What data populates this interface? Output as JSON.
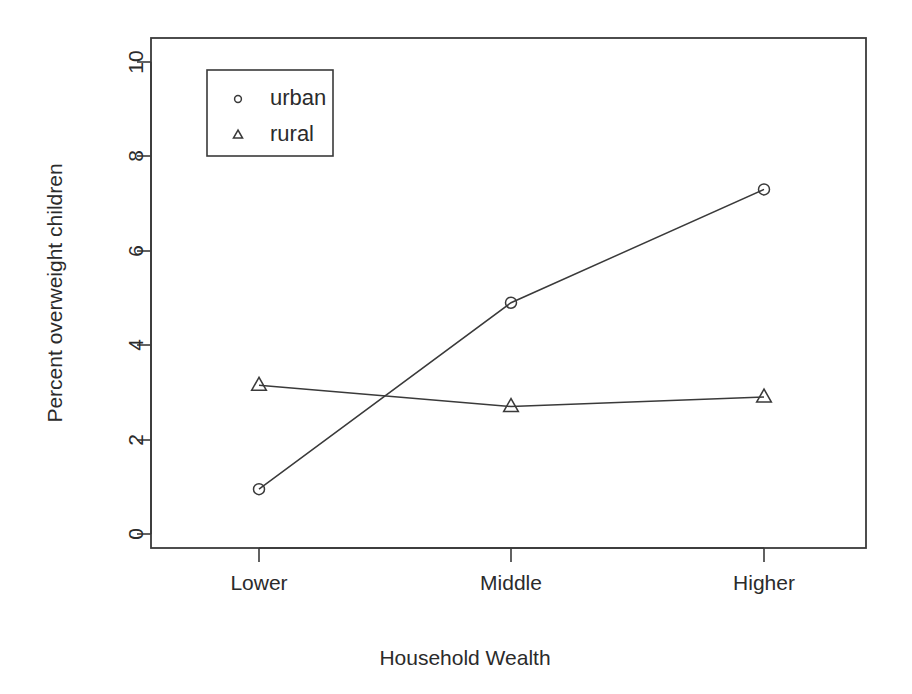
{
  "chart_data": {
    "type": "line",
    "title": "",
    "xlabel": "Household Wealth",
    "ylabel": "Percent overweight children",
    "categories": [
      "Lower",
      "Middle",
      "Higher"
    ],
    "ylim": [
      0,
      10
    ],
    "yticks": [
      "0",
      "2",
      "4",
      "6",
      "8",
      "10"
    ],
    "grid": false,
    "legend_position": "top-left inside plot",
    "series": [
      {
        "name": "urban",
        "marker": "circle",
        "values": [
          0.95,
          4.9,
          7.3
        ]
      },
      {
        "name": "rural",
        "marker": "triangle",
        "values": [
          3.15,
          2.7,
          2.9
        ]
      }
    ]
  },
  "axes": {
    "y_title": "Percent overweight children",
    "x_title": "Household Wealth",
    "y_tick_labels": [
      "10",
      "8",
      "6",
      "4",
      "2",
      "0"
    ],
    "x_tick_labels": [
      "Lower",
      "Middle",
      "Higher"
    ]
  },
  "legend": {
    "entries": [
      {
        "label": "urban",
        "marker": "circle"
      },
      {
        "label": "rural",
        "marker": "triangle"
      }
    ]
  },
  "colors": {
    "ink": "#3a3a3a",
    "text": "#2b2b2b",
    "background": "#ffffff"
  }
}
